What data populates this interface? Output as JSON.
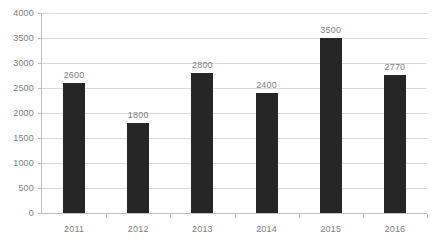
{
  "chart_data": {
    "type": "bar",
    "title": "",
    "subtitle": "",
    "xlabel": "",
    "ylabel": "",
    "categories": [
      "2011",
      "2012",
      "2013",
      "2014",
      "2015",
      "2016"
    ],
    "values": [
      2600,
      1800,
      2800,
      2400,
      3500,
      2770
    ],
    "data_labels": [
      "2600",
      "1800",
      "2800",
      "2400",
      "3500",
      "2770"
    ],
    "ylim": [
      0,
      4000
    ],
    "ytick_labels": [
      "4000",
      "3500",
      "3000",
      "2500",
      "2000",
      "1500",
      "1000",
      "500",
      "0"
    ],
    "ytick_values": [
      4000,
      3500,
      3000,
      2500,
      2000,
      1500,
      1000,
      500,
      0
    ],
    "ytick_step": 500,
    "grid": true,
    "grid_axis": "y",
    "legend": false,
    "legend_position": "none",
    "series": [
      {
        "name": "",
        "values": [
          2600,
          1800,
          2800,
          2400,
          3500,
          2770
        ]
      }
    ],
    "colors": {
      "bar": "#262626",
      "gridline": "#d9d9d9",
      "axis": "#bfbfbf",
      "tick_label": "#808080",
      "data_label": "#808080",
      "background": "#ffffff"
    }
  }
}
